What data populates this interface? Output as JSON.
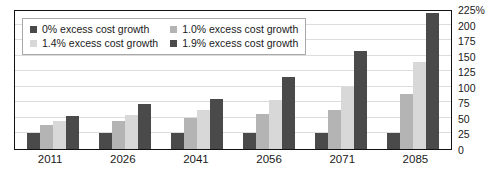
{
  "top_sliver_text": "",
  "chart_data": {
    "type": "bar",
    "title": "",
    "subtitle": "",
    "xlabel": "",
    "ylabel": "",
    "categories": [
      "2011",
      "2026",
      "2041",
      "2056",
      "2071",
      "2085"
    ],
    "series": [
      {
        "name": "0% excess cost growth",
        "color": "#4a4a4a",
        "values": [
          25,
          25,
          25,
          25,
          25,
          26
        ]
      },
      {
        "name": "1.0% excess cost growth",
        "color": "#b4b4b4",
        "values": [
          39,
          45,
          50,
          57,
          63,
          88
        ]
      },
      {
        "name": "1.4% excess cost growth",
        "color": "#d8d8d8",
        "values": [
          45,
          54,
          62,
          78,
          100,
          140
        ]
      },
      {
        "name": "1.9% excess cost growth",
        "color": "#4a4a4a",
        "values": [
          53,
          72,
          80,
          115,
          158,
          218
        ]
      }
    ],
    "ylim": [
      0,
      225
    ],
    "ytick_values": [
      225,
      200,
      175,
      150,
      125,
      100,
      75,
      50,
      25,
      0
    ],
    "ytick_labels": [
      "225%",
      "200",
      "175",
      "150",
      "125",
      "100",
      "75",
      "50",
      "25",
      "0"
    ],
    "grid": true,
    "grid_axis": "y",
    "legend_position": "upper left",
    "yaxis_position": "right"
  },
  "legend": {
    "items": [
      {
        "label": "0% excess cost growth",
        "color": "#4a4a4a"
      },
      {
        "label": "1.0% excess cost growth",
        "color": "#b4b4b4"
      },
      {
        "label": "1.4% excess cost growth",
        "color": "#d8d8d8"
      },
      {
        "label": "1.9% excess cost growth",
        "color": "#4a4a4a"
      }
    ]
  },
  "colors": {
    "plot_border": "#111111",
    "gridline": "#dcdcdc",
    "background": "#ffffff",
    "text": "#1a1a1a"
  }
}
